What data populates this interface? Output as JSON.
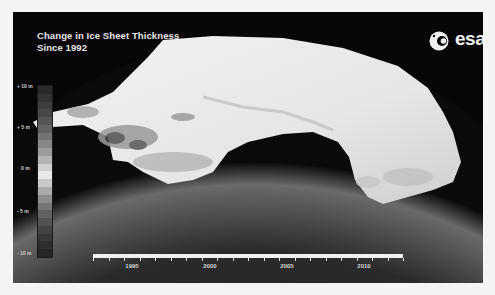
{
  "title": {
    "line1": "Change in Ice Sheet Thickness",
    "line2": "Since 1992"
  },
  "logo": {
    "icon": "esa-swirl-icon",
    "text": "esa"
  },
  "legend": {
    "labels": [
      "+ 10 m",
      "+ 5 m",
      "0 m",
      "- 5 m",
      "- 10 m"
    ],
    "steps": [
      "#2a2a2a",
      "#333333",
      "#3d3d3d",
      "#474747",
      "#555555",
      "#636363",
      "#747474",
      "#878787",
      "#9c9c9c",
      "#b4b4b4",
      "#d0d0d0",
      "#e8e8e8",
      "#c8c8c8",
      "#aaaaaa",
      "#8e8e8e",
      "#767676",
      "#626262",
      "#515151",
      "#434343",
      "#373737",
      "#2e2e2e",
      "#262626"
    ]
  },
  "timeline": {
    "start_year": 1992,
    "end_year": 2012,
    "labels": [
      "1995",
      "2000",
      "2005",
      "2010"
    ]
  },
  "colors": {
    "background": "#070707",
    "ice": "#e9e9e9",
    "text": "#e6e6e6"
  }
}
